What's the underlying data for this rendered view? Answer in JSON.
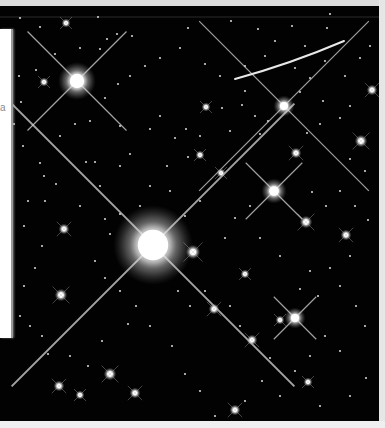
{
  "image": {
    "subject": "star field",
    "background_color": "#020202",
    "frame_color": "#d9d9d9",
    "left_panel": {
      "color": "#ffffff",
      "glyph": "a"
    }
  },
  "bright_stars": [
    {
      "name": "central-star",
      "x": 153,
      "y": 239,
      "r": 19,
      "spike_len": 200
    },
    {
      "name": "upper-left-star",
      "x": 77,
      "y": 75,
      "r": 9,
      "spike_len": 70
    },
    {
      "name": "right-star-1",
      "x": 274,
      "y": 185,
      "r": 6,
      "spike_len": 40
    },
    {
      "name": "right-star-2",
      "x": 284,
      "y": 100,
      "r": 5,
      "spike_len": 120
    },
    {
      "name": "lower-right-star",
      "x": 295,
      "y": 312,
      "r": 5,
      "spike_len": 30
    }
  ],
  "medium_stars": [
    [
      306,
      216,
      3.5
    ],
    [
      346,
      229,
      3
    ],
    [
      361,
      135,
      3.5
    ],
    [
      296,
      147,
      3
    ],
    [
      193,
      246,
      4
    ],
    [
      64,
      223,
      3
    ],
    [
      61,
      289,
      3.5
    ],
    [
      110,
      368,
      3.5
    ],
    [
      59,
      380,
      3
    ],
    [
      135,
      387,
      3
    ],
    [
      80,
      389,
      2.5
    ],
    [
      221,
      167,
      2.5
    ],
    [
      206,
      101,
      2.5
    ],
    [
      214,
      303,
      3
    ],
    [
      252,
      334,
      3
    ],
    [
      235,
      404,
      3
    ],
    [
      44,
      76,
      2.5
    ],
    [
      66,
      17,
      2.5
    ],
    [
      280,
      314,
      2.5
    ],
    [
      245,
      268,
      2.5
    ],
    [
      200,
      149,
      2.5
    ],
    [
      372,
      84,
      3
    ],
    [
      308,
      376,
      2.5
    ]
  ],
  "small_stars": [
    [
      20,
      12
    ],
    [
      40,
      21
    ],
    [
      98,
      11
    ],
    [
      188,
      22
    ],
    [
      231,
      15
    ],
    [
      258,
      23
    ],
    [
      292,
      20
    ],
    [
      327,
      22
    ],
    [
      330,
      8
    ],
    [
      117,
      28
    ],
    [
      132,
      30
    ],
    [
      107,
      33
    ],
    [
      100,
      43
    ],
    [
      80,
      42
    ],
    [
      55,
      48
    ],
    [
      36,
      64
    ],
    [
      19,
      70
    ],
    [
      21,
      96
    ],
    [
      14,
      118
    ],
    [
      23,
      140
    ],
    [
      40,
      157
    ],
    [
      44,
      170
    ],
    [
      56,
      178
    ],
    [
      86,
      156
    ],
    [
      95,
      156
    ],
    [
      120,
      160
    ],
    [
      130,
      148
    ],
    [
      150,
      123
    ],
    [
      160,
      110
    ],
    [
      175,
      132
    ],
    [
      186,
      123
    ],
    [
      188,
      151
    ],
    [
      167,
      160
    ],
    [
      200,
      130
    ],
    [
      222,
      102
    ],
    [
      242,
      99
    ],
    [
      260,
      128
    ],
    [
      268,
      115
    ],
    [
      307,
      127
    ],
    [
      320,
      118
    ],
    [
      340,
      112
    ],
    [
      350,
      153
    ],
    [
      365,
      165
    ],
    [
      340,
      185
    ],
    [
      326,
      200
    ],
    [
      312,
      186
    ],
    [
      355,
      200
    ],
    [
      368,
      214
    ],
    [
      350,
      250
    ],
    [
      330,
      262
    ],
    [
      310,
      265
    ],
    [
      300,
      283
    ],
    [
      318,
      290
    ],
    [
      340,
      280
    ],
    [
      356,
      300
    ],
    [
      365,
      320
    ],
    [
      325,
      330
    ],
    [
      340,
      345
    ],
    [
      310,
      350
    ],
    [
      295,
      365
    ],
    [
      270,
      352
    ],
    [
      262,
      375
    ],
    [
      280,
      390
    ],
    [
      320,
      400
    ],
    [
      350,
      390
    ],
    [
      366,
      372
    ],
    [
      245,
      395
    ],
    [
      215,
      410
    ],
    [
      200,
      385
    ],
    [
      185,
      368
    ],
    [
      172,
      340
    ],
    [
      150,
      320
    ],
    [
      128,
      318
    ],
    [
      102,
      335
    ],
    [
      88,
      360
    ],
    [
      70,
      350
    ],
    [
      48,
      348
    ],
    [
      42,
      330
    ],
    [
      30,
      320
    ],
    [
      20,
      310
    ],
    [
      24,
      280
    ],
    [
      35,
      262
    ],
    [
      42,
      240
    ],
    [
      24,
      220
    ],
    [
      28,
      195
    ],
    [
      45,
      195
    ],
    [
      80,
      200
    ],
    [
      100,
      180
    ],
    [
      105,
      213
    ],
    [
      110,
      228
    ],
    [
      120,
      208
    ],
    [
      95,
      255
    ],
    [
      105,
      272
    ],
    [
      120,
      285
    ],
    [
      136,
      300
    ],
    [
      178,
      285
    ],
    [
      190,
      300
    ],
    [
      205,
      285
    ],
    [
      230,
      300
    ],
    [
      240,
      320
    ],
    [
      225,
      232
    ],
    [
      235,
      212
    ],
    [
      250,
      200
    ],
    [
      260,
      232
    ],
    [
      280,
      250
    ],
    [
      200,
      195
    ],
    [
      185,
      210
    ],
    [
      170,
      185
    ],
    [
      150,
      180
    ],
    [
      140,
      200
    ],
    [
      205,
      58
    ],
    [
      220,
      70
    ],
    [
      180,
      42
    ],
    [
      160,
      52
    ],
    [
      145,
      60
    ],
    [
      130,
      70
    ],
    [
      118,
      78
    ],
    [
      105,
      92
    ],
    [
      90,
      115
    ],
    [
      75,
      118
    ],
    [
      60,
      130
    ],
    [
      120,
      120
    ],
    [
      245,
      60
    ],
    [
      265,
      50
    ],
    [
      295,
      62
    ],
    [
      310,
      72
    ],
    [
      325,
      55
    ],
    [
      345,
      70
    ],
    [
      360,
      52
    ],
    [
      370,
      40
    ],
    [
      305,
      40
    ],
    [
      275,
      35
    ],
    [
      350,
      100
    ],
    [
      323,
      95
    ],
    [
      300,
      86
    ],
    [
      255,
      110
    ],
    [
      245,
      85
    ],
    [
      230,
      125
    ]
  ],
  "streak": {
    "x1": 235,
    "y1": 73,
    "cx": 290,
    "cy": 58,
    "x2": 344,
    "y2": 35,
    "color": "#e8e8e8"
  }
}
